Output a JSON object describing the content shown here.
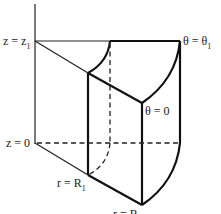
{
  "diagram": {
    "labels": {
      "z_top": "z = z",
      "z_top_sub": "1",
      "z_bottom": "z = 0",
      "theta_top": "θ = θ",
      "theta_top_sub": "1",
      "theta_zero": "θ = 0",
      "r_inner": "r = R",
      "r_inner_sub": "1",
      "r_outer": "r = R",
      "r_outer_sub": "2"
    },
    "colors": {
      "line": "#111111",
      "background": "#ffffff"
    }
  }
}
